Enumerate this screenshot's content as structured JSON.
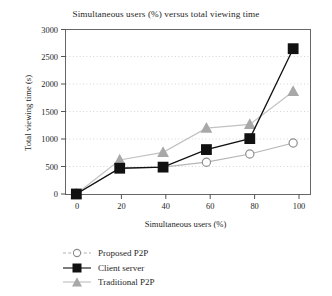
{
  "chart_data": {
    "type": "line",
    "title": "Simultaneous users (%) versus total viewing time",
    "xlabel": "Simultaneous users (%)",
    "ylabel": "Total viewing time (s)",
    "x": [
      0,
      20,
      40,
      60,
      80,
      100
    ],
    "xlim": [
      -5,
      108
    ],
    "ylim": [
      0,
      3000
    ],
    "xticks": [
      "0",
      "20",
      "40",
      "60",
      "80",
      "100"
    ],
    "yticks": [
      "0",
      "500",
      "1000",
      "1500",
      "2000",
      "2500",
      "3000"
    ],
    "grid": "horizontal-dotted",
    "legend_position": "below-left",
    "series": [
      {
        "name": "Proposed P2P",
        "marker": "open-circle",
        "color": "#b0b0b0",
        "values": [
          0,
          470,
          490,
          580,
          730,
          930
        ]
      },
      {
        "name": "Client server",
        "marker": "filled-square",
        "color": "#111111",
        "values": [
          0,
          470,
          490,
          810,
          1010,
          2650
        ]
      },
      {
        "name": "Traditional P2P",
        "marker": "filled-triangle",
        "color": "#a8a8a8",
        "values": [
          0,
          620,
          760,
          1200,
          1270,
          1870
        ]
      }
    ]
  },
  "legend": {
    "items": [
      {
        "label": "Proposed P2P"
      },
      {
        "label": "Client server"
      },
      {
        "label": "Traditional P2P"
      }
    ]
  },
  "colors": {
    "series_proposed": "#b0b0b0",
    "series_client_server": "#111111",
    "series_traditional": "#a8a8a8",
    "grid": "#d8d8d8",
    "axis": "#555555",
    "background": "#ffffff"
  }
}
